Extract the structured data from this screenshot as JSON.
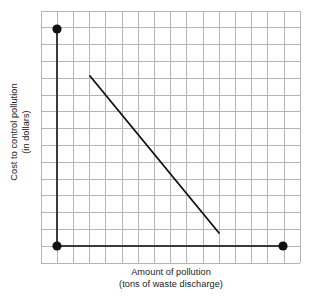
{
  "chart_data": {
    "type": "line",
    "title": "",
    "xlabel": "Amount of pollution",
    "xlabel_sub": "(tons of waste discharge)",
    "ylabel": "Cost to control pollution",
    "ylabel_sub": "(in dollars)",
    "grid": true,
    "grid_columns": 16,
    "grid_rows": 15,
    "xlim": [
      0,
      16
    ],
    "ylim": [
      0,
      15
    ],
    "axis_origin": [
      1,
      1
    ],
    "series": [
      {
        "name": "cost-curve",
        "type": "line",
        "x": [
          3,
          11
        ],
        "y": [
          12,
          2
        ],
        "color": "#111111"
      }
    ],
    "points": [
      {
        "name": "y-axis-top-marker",
        "x": 1,
        "y": 14.5,
        "color": "#111111"
      },
      {
        "name": "origin-marker",
        "x": 1,
        "y": 1,
        "color": "#111111"
      },
      {
        "name": "x-axis-end-marker",
        "x": 15,
        "y": 1,
        "color": "#111111"
      }
    ],
    "xticklabels": [],
    "yticklabels": [],
    "legend": null,
    "annotations": []
  },
  "colors": {
    "grid_line": "#b5b5b5",
    "axis_line": "#3a3a3a",
    "data_line": "#111111",
    "marker": "#111111",
    "background": "#ffffff",
    "text": "#1a1a1a"
  },
  "geometry": {
    "grid_left": 41,
    "grid_top": 11,
    "grid_right": 300,
    "grid_bottom": 263,
    "cell_w": 16.2,
    "cell_h": 16.8,
    "axis_x": 57,
    "axis_y": 246,
    "axis_top": 29,
    "axis_right": 283,
    "line_x1": 90,
    "line_y1": 76,
    "line_x2": 219,
    "line_y2": 233,
    "marker_radius": 4.6
  }
}
